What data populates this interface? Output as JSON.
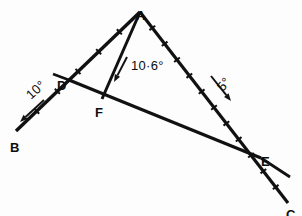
{
  "figure": {
    "background_color": "#fdfdfd",
    "ink_color": "#111111",
    "width": 302,
    "height": 216
  },
  "points": [
    {
      "id": "A",
      "label": "A",
      "x": 140,
      "y": 12,
      "label_x": 136,
      "label_y": 10
    },
    {
      "id": "B",
      "label": "B",
      "x": 16,
      "y": 131,
      "label_x": 10,
      "label_y": 142
    },
    {
      "id": "C",
      "label": "C",
      "x": 288,
      "y": 203,
      "label_x": 286,
      "label_y": 209
    },
    {
      "id": "D",
      "label": "D",
      "x": 69,
      "y": 80,
      "label_x": 57,
      "label_y": 80
    },
    {
      "id": "E",
      "label": "E",
      "x": 261,
      "y": 158,
      "label_x": 261,
      "label_y": 156
    },
    {
      "id": "F",
      "label": "F",
      "x": 102,
      "y": 99,
      "label_x": 95,
      "label_y": 107
    }
  ],
  "segments": [
    {
      "id": "AB",
      "name": "incident-ray-AB",
      "from": "A",
      "to": "B",
      "width": 3.4,
      "ticks": 5
    },
    {
      "id": "AF",
      "name": "ray-AF",
      "from": "A",
      "to": "F",
      "width": 3.0,
      "ticks": 0
    },
    {
      "id": "AE",
      "name": "ray-AE",
      "from": "A",
      "to": "C",
      "width": 3.2,
      "ticks": 11
    },
    {
      "id": "DE",
      "name": "boundary-line-DE",
      "from": "D",
      "to": "E",
      "width": 3.2,
      "ticks": 0
    }
  ],
  "extensions": [
    {
      "id": "D-stub",
      "name": "boundary-stub-past-D",
      "x1": 69,
      "y1": 80,
      "x2": 53,
      "y2": 74
    },
    {
      "id": "E-stub",
      "name": "boundary-stub-past-E",
      "x1": 261,
      "y1": 158,
      "x2": 290,
      "y2": 177
    }
  ],
  "annotations": [
    {
      "id": "ang-10",
      "name": "angle-label-10",
      "text": "10°",
      "text_x": 31,
      "text_y": 100,
      "rotation": -42,
      "arrow": {
        "x1": 44,
        "y1": 100,
        "x2": 20,
        "y2": 122
      }
    },
    {
      "id": "ang-10-6",
      "name": "angle-label-10-6",
      "text": "10·6°",
      "text_x": 131,
      "text_y": 70,
      "rotation": 0,
      "arrow": {
        "x1": 127,
        "y1": 57,
        "x2": 114,
        "y2": 82
      }
    },
    {
      "id": "ang-5",
      "name": "angle-label-5",
      "text": "5°",
      "text_x": 223,
      "text_y": 92,
      "rotation": -50,
      "arrow": {
        "x1": 211,
        "y1": 76,
        "x2": 231,
        "y2": 101
      }
    }
  ]
}
